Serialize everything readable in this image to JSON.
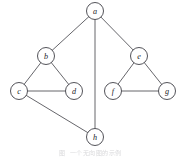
{
  "figure": {
    "caption": "图 ﻿ 一个无向图的示例",
    "caption_legible": false,
    "background_color": "#ffffff",
    "edge_color": "#55555a",
    "node_stroke_color": "#4a4a50",
    "node_fill_color": "#ffffff",
    "label_color": "#222228",
    "node_radius": 8.5,
    "width": 181,
    "height": 159
  },
  "graph_data": {
    "type": "node-link-diagram",
    "directed": false,
    "node_count": 8,
    "edge_count": 10,
    "nodes": [
      {
        "id": "a",
        "label": "a",
        "cx": 95,
        "cy": 11
      },
      {
        "id": "b",
        "label": "b",
        "cx": 46,
        "cy": 56
      },
      {
        "id": "e",
        "label": "e",
        "cx": 139,
        "cy": 56
      },
      {
        "id": "c",
        "label": "c",
        "cx": 19,
        "cy": 91
      },
      {
        "id": "d",
        "label": "d",
        "cx": 74,
        "cy": 91
      },
      {
        "id": "f",
        "label": "f",
        "cx": 113,
        "cy": 91
      },
      {
        "id": "g",
        "label": "g",
        "cx": 167,
        "cy": 91
      },
      {
        "id": "h",
        "label": "h",
        "cx": 95,
        "cy": 137
      }
    ],
    "edges": [
      {
        "source": "a",
        "target": "b"
      },
      {
        "source": "a",
        "target": "h"
      },
      {
        "source": "a",
        "target": "e"
      },
      {
        "source": "b",
        "target": "c"
      },
      {
        "source": "b",
        "target": "d"
      },
      {
        "source": "c",
        "target": "d"
      },
      {
        "source": "c",
        "target": "h"
      },
      {
        "source": "e",
        "target": "f"
      },
      {
        "source": "e",
        "target": "g"
      },
      {
        "source": "f",
        "target": "g"
      }
    ]
  }
}
